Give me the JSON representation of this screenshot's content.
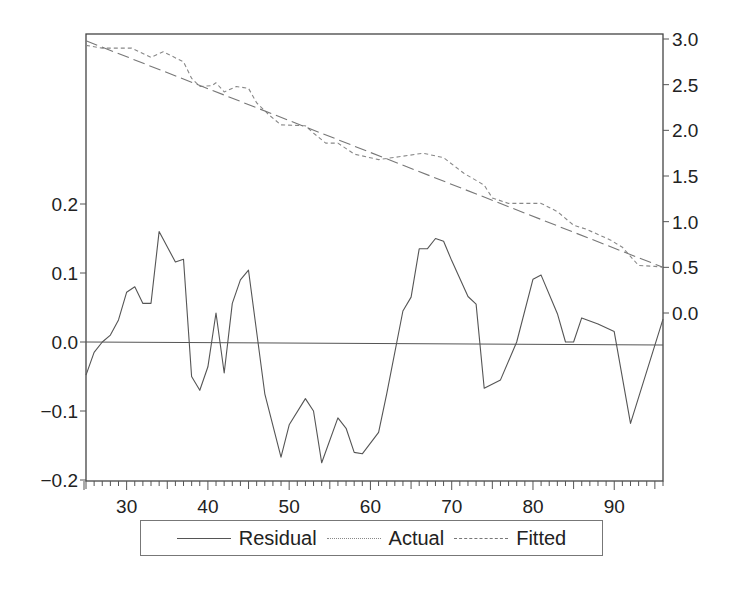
{
  "chart_data": {
    "type": "line",
    "title": "",
    "xlabel": "",
    "ylabel_left": "",
    "ylabel_right": "",
    "x_range": [
      25,
      96
    ],
    "x_ticks": [
      30,
      40,
      50,
      60,
      70,
      80,
      90
    ],
    "x_tick_labels": [
      "30",
      "40",
      "50",
      "60",
      "70",
      "80",
      "90"
    ],
    "left_axis": {
      "series": [
        "Residual"
      ],
      "range": [
        -0.2,
        0.2
      ],
      "ticks": [
        0.2,
        0.1,
        0.0,
        -0.1,
        -0.2
      ],
      "tick_labels": [
        "0.2",
        "0.1",
        "0.0",
        "−0.1",
        "−0.2"
      ]
    },
    "right_axis": {
      "series": [
        "Actual",
        "Fitted"
      ],
      "range": [
        0.0,
        3.0
      ],
      "ticks": [
        3.0,
        2.5,
        2.0,
        1.5,
        1.0,
        0.5,
        0.0
      ],
      "tick_labels": [
        "3.0",
        "2.5",
        "2.0",
        "1.5",
        "1.0",
        "0.5",
        "0.0"
      ]
    },
    "grid": false,
    "zero_line": true,
    "legend_position": "bottom",
    "series": [
      {
        "name": "Residual",
        "axis": "left",
        "style": "solid",
        "color": "#555555",
        "x": [
          25,
          26,
          27,
          28,
          29,
          30,
          31,
          32,
          33,
          34,
          36,
          37,
          38,
          39,
          40,
          41,
          42,
          43,
          44,
          45,
          47,
          49,
          50,
          52,
          53,
          54,
          56,
          57,
          58,
          59,
          61,
          62,
          64,
          65,
          66,
          67,
          68,
          69,
          70,
          72,
          73,
          74,
          76,
          78,
          80,
          81,
          83,
          84,
          85,
          86,
          88,
          90,
          92,
          96
        ],
        "values": [
          -0.048,
          -0.015,
          0.0,
          0.01,
          0.032,
          0.072,
          0.08,
          0.056,
          0.056,
          0.16,
          0.116,
          0.12,
          -0.05,
          -0.07,
          -0.036,
          0.042,
          -0.045,
          0.056,
          0.09,
          0.104,
          -0.075,
          -0.167,
          -0.12,
          -0.082,
          -0.1,
          -0.175,
          -0.11,
          -0.125,
          -0.16,
          -0.162,
          -0.131,
          -0.075,
          0.045,
          0.065,
          0.135,
          0.135,
          0.15,
          0.146,
          0.118,
          0.066,
          0.055,
          -0.067,
          -0.055,
          0.0,
          0.091,
          0.097,
          0.041,
          0.0,
          0.0,
          0.035,
          0.026,
          0.015,
          -0.118,
          0.033
        ]
      },
      {
        "name": "Actual",
        "axis": "right",
        "style": "dotted",
        "color": "#888888",
        "x": [
          25,
          27,
          30.6,
          33,
          34.5,
          37,
          38,
          39,
          40.5,
          41,
          42,
          43.5,
          45,
          46,
          47.5,
          49,
          52,
          53,
          54.5,
          56,
          58,
          61,
          63.5,
          66.5,
          69,
          71.5,
          74,
          75,
          77,
          81,
          83,
          85,
          86.5,
          89.5,
          91,
          93,
          95,
          96
        ],
        "values": [
          2.93,
          2.9,
          2.9,
          2.8,
          2.86,
          2.75,
          2.57,
          2.48,
          2.49,
          2.52,
          2.42,
          2.48,
          2.46,
          2.3,
          2.17,
          2.06,
          2.05,
          1.97,
          1.86,
          1.86,
          1.74,
          1.68,
          1.71,
          1.75,
          1.7,
          1.53,
          1.4,
          1.26,
          1.2,
          1.2,
          1.11,
          0.96,
          0.92,
          0.8,
          0.72,
          0.52,
          0.51,
          0.5
        ]
      },
      {
        "name": "Fitted",
        "axis": "right",
        "style": "dashed",
        "color": "#777777",
        "x": [
          25,
          96
        ],
        "values": [
          2.98,
          0.5
        ]
      }
    ]
  },
  "legend": {
    "items": [
      {
        "label": "Residual",
        "style": "solid"
      },
      {
        "label": "Actual",
        "style": "dotted"
      },
      {
        "label": "Fitted",
        "style": "dashed"
      }
    ]
  }
}
